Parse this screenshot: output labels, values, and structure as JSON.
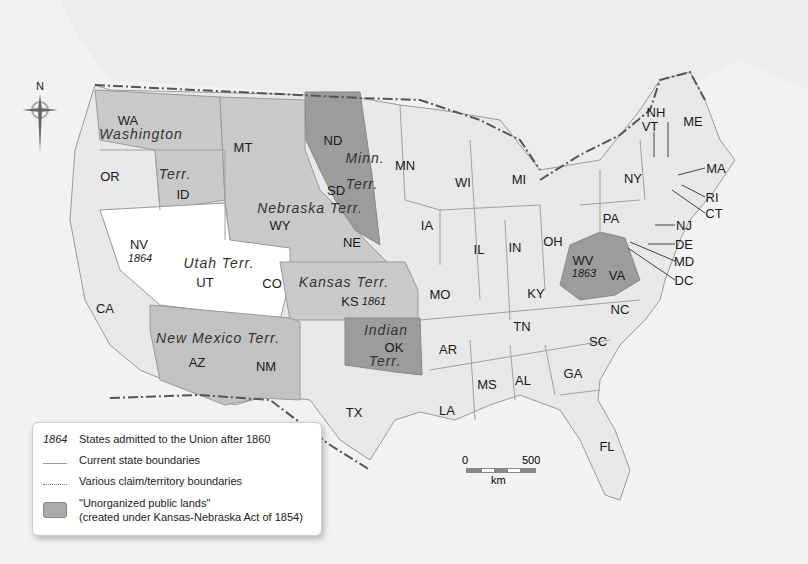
{
  "map": {
    "colors": {
      "background": "#f0f0f0",
      "land": "#e6e6e6",
      "state_fill": "#e9e9e9",
      "territory_light": "#c8c8c8",
      "unorganized_dark": "#9c9c9c",
      "utah_white": "#ffffff",
      "boundary": "#9e9e9e",
      "border_line": "#555555"
    },
    "compass": {
      "label": "N"
    },
    "states": [
      {
        "abbr": "WA",
        "x": 128,
        "y": 120
      },
      {
        "abbr": "OR",
        "x": 110,
        "y": 176
      },
      {
        "abbr": "CA",
        "x": 105,
        "y": 308
      },
      {
        "abbr": "ID",
        "x": 183,
        "y": 194
      },
      {
        "abbr": "MT",
        "x": 243,
        "y": 147
      },
      {
        "abbr": "NV",
        "x": 139,
        "y": 244
      },
      {
        "abbr": "UT",
        "x": 205,
        "y": 282
      },
      {
        "abbr": "WY",
        "x": 280,
        "y": 225
      },
      {
        "abbr": "CO",
        "x": 272,
        "y": 283
      },
      {
        "abbr": "AZ",
        "x": 197,
        "y": 362
      },
      {
        "abbr": "NM",
        "x": 266,
        "y": 366
      },
      {
        "abbr": "ND",
        "x": 333,
        "y": 140
      },
      {
        "abbr": "SD",
        "x": 336,
        "y": 190
      },
      {
        "abbr": "NE",
        "x": 352,
        "y": 242
      },
      {
        "abbr": "KS",
        "x": 350,
        "y": 301
      },
      {
        "abbr": "OK",
        "x": 394,
        "y": 347
      },
      {
        "abbr": "TX",
        "x": 354,
        "y": 412
      },
      {
        "abbr": "MN",
        "x": 405,
        "y": 165
      },
      {
        "abbr": "IA",
        "x": 427,
        "y": 225
      },
      {
        "abbr": "MO",
        "x": 440,
        "y": 294
      },
      {
        "abbr": "AR",
        "x": 448,
        "y": 349
      },
      {
        "abbr": "LA",
        "x": 447,
        "y": 410
      },
      {
        "abbr": "WI",
        "x": 463,
        "y": 182
      },
      {
        "abbr": "IL",
        "x": 479,
        "y": 249
      },
      {
        "abbr": "MI",
        "x": 519,
        "y": 179
      },
      {
        "abbr": "IN",
        "x": 515,
        "y": 247
      },
      {
        "abbr": "OH",
        "x": 553,
        "y": 241
      },
      {
        "abbr": "KY",
        "x": 536,
        "y": 293
      },
      {
        "abbr": "TN",
        "x": 522,
        "y": 326
      },
      {
        "abbr": "MS",
        "x": 487,
        "y": 384
      },
      {
        "abbr": "AL",
        "x": 523,
        "y": 380
      },
      {
        "abbr": "GA",
        "x": 573,
        "y": 373
      },
      {
        "abbr": "SC",
        "x": 598,
        "y": 341
      },
      {
        "abbr": "FL",
        "x": 607,
        "y": 446
      },
      {
        "abbr": "NC",
        "x": 620,
        "y": 309
      },
      {
        "abbr": "VA",
        "x": 617,
        "y": 275
      },
      {
        "abbr": "WV",
        "x": 583,
        "y": 260
      },
      {
        "abbr": "PA",
        "x": 611,
        "y": 218
      },
      {
        "abbr": "NY",
        "x": 633,
        "y": 178
      },
      {
        "abbr": "VT",
        "x": 650,
        "y": 126
      },
      {
        "abbr": "NH",
        "x": 656,
        "y": 112
      },
      {
        "abbr": "ME",
        "x": 693,
        "y": 121
      }
    ],
    "callouts": [
      {
        "abbr": "MA",
        "x": 716,
        "y": 168
      },
      {
        "abbr": "RI",
        "x": 712,
        "y": 197
      },
      {
        "abbr": "CT",
        "x": 714,
        "y": 213
      },
      {
        "abbr": "NJ",
        "x": 684,
        "y": 225
      },
      {
        "abbr": "DE",
        "x": 684,
        "y": 244
      },
      {
        "abbr": "MD",
        "x": 684,
        "y": 261
      },
      {
        "abbr": "DC",
        "x": 684,
        "y": 280
      }
    ],
    "territories": [
      {
        "label": "Washington",
        "x": 141,
        "y": 134
      },
      {
        "label": "Terr.",
        "x": 175,
        "y": 174
      },
      {
        "label": "Minn.",
        "x": 365,
        "y": 158
      },
      {
        "label": "Terr.",
        "x": 362,
        "y": 184
      },
      {
        "label": "Nebraska Terr.",
        "x": 310,
        "y": 208
      },
      {
        "label": "Utah Terr.",
        "x": 219,
        "y": 263
      },
      {
        "label": "Kansas Terr.",
        "x": 344,
        "y": 282
      },
      {
        "label": "New Mexico Terr.",
        "x": 218,
        "y": 338
      },
      {
        "label": "Indian",
        "x": 386,
        "y": 330
      },
      {
        "label": "Terr.",
        "x": 385,
        "y": 361
      }
    ],
    "admission_years": [
      {
        "state": "NV",
        "year": "1864",
        "x": 140,
        "y": 258
      },
      {
        "state": "KS",
        "year": "1861",
        "x": 374,
        "y": 301
      },
      {
        "state": "WV",
        "year": "1863",
        "x": 584,
        "y": 273
      }
    ]
  },
  "legend": {
    "items": [
      {
        "key": "1864",
        "text": "States admitted to the Union after 1860"
      },
      {
        "key": "solid-line",
        "text": "Current state boundaries"
      },
      {
        "key": "dotted-line",
        "text": "Various claim/territory boundaries"
      },
      {
        "key": "swatch",
        "text": "\"Unorganized public lands\"",
        "text2": "(created under Kansas-Nebraska Act of 1854)"
      }
    ]
  },
  "scale_bar": {
    "start": "0",
    "end": "500",
    "unit": "km"
  }
}
